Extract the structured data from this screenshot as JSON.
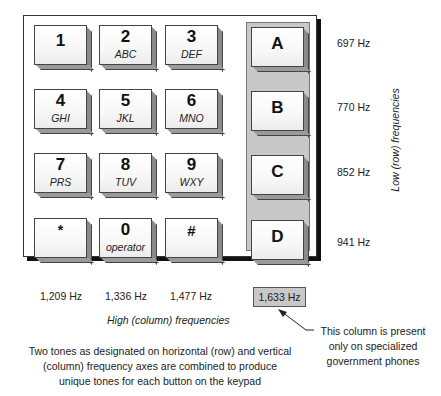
{
  "keypad": {
    "keys": [
      {
        "digit": "1",
        "letters": ""
      },
      {
        "digit": "2",
        "letters": "ABC"
      },
      {
        "digit": "3",
        "letters": "DEF"
      },
      {
        "digit": "A",
        "letters": ""
      },
      {
        "digit": "4",
        "letters": "GHI"
      },
      {
        "digit": "5",
        "letters": "JKL"
      },
      {
        "digit": "6",
        "letters": "MNO"
      },
      {
        "digit": "B",
        "letters": ""
      },
      {
        "digit": "7",
        "letters": "PRS"
      },
      {
        "digit": "8",
        "letters": "TUV"
      },
      {
        "digit": "9",
        "letters": "WXY"
      },
      {
        "digit": "C",
        "letters": ""
      },
      {
        "digit": "*",
        "letters": ""
      },
      {
        "digit": "0",
        "letters": "operator"
      },
      {
        "digit": "#",
        "letters": ""
      },
      {
        "digit": "D",
        "letters": ""
      }
    ]
  },
  "row_frequencies": [
    "697 Hz",
    "770 Hz",
    "852 Hz",
    "941 Hz"
  ],
  "column_frequencies": [
    "1,209 Hz",
    "1,336 Hz",
    "1,477 Hz",
    "1,633 Hz"
  ],
  "labels": {
    "high_axis": "High (column) frequencies",
    "low_axis": "Low (row) frequencies",
    "caption_lines": [
      "Two tones as designated on horizontal (row) and vertical",
      "(column) frequency axes are combined to produce",
      "unique tones for each button on the keypad"
    ],
    "note_lines": [
      "This column is present",
      "only on specialized",
      "government phones"
    ]
  },
  "colors": {
    "panel_gray": "#c8c8c8",
    "frame_shadow": "#111111"
  }
}
